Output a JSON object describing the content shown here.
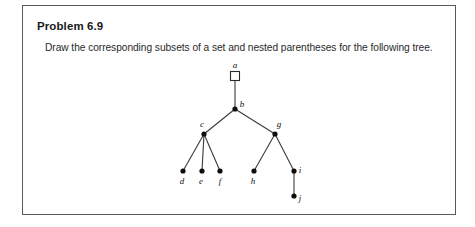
{
  "page": {
    "background_color": "#fefefe"
  },
  "problem": {
    "title": "Problem 6.9",
    "statement": "Draw the corresponding subsets of a set and nested parentheses for the following  tree.",
    "border_color": "#5a5a5a",
    "background_color": "#ffffff"
  },
  "figure": {
    "type": "tree-diagram",
    "name": "rooted-tree",
    "root_shape": "square",
    "node_shape": "filled-circle",
    "node_color": "#0d0d0d",
    "edge_color": "#3a3a3a",
    "nodes": [
      {
        "id": "a",
        "label": "a",
        "x": 212,
        "y": 70,
        "shape": "square",
        "label_dx": 0,
        "label_dy": -8
      },
      {
        "id": "b",
        "label": "b",
        "x": 212,
        "y": 103,
        "shape": "circle",
        "label_dx": 7,
        "label_dy": -2
      },
      {
        "id": "c",
        "label": "c",
        "x": 181,
        "y": 128,
        "shape": "circle",
        "label_dx": -2,
        "label_dy": -7
      },
      {
        "id": "g",
        "label": "g",
        "x": 252,
        "y": 128,
        "shape": "circle",
        "label_dx": 4,
        "label_dy": -7
      },
      {
        "id": "d",
        "label": "d",
        "x": 160,
        "y": 165,
        "shape": "circle",
        "label_dx": -1,
        "label_dy": 13
      },
      {
        "id": "e",
        "label": "e",
        "x": 179,
        "y": 165,
        "shape": "circle",
        "label_dx": -1,
        "label_dy": 13
      },
      {
        "id": "f",
        "label": "f",
        "x": 197,
        "y": 165,
        "shape": "circle",
        "label_dx": 0,
        "label_dy": 13
      },
      {
        "id": "h",
        "label": "h",
        "x": 231,
        "y": 165,
        "shape": "circle",
        "label_dx": -1,
        "label_dy": 13
      },
      {
        "id": "i",
        "label": "i",
        "x": 271,
        "y": 165,
        "shape": "circle",
        "label_dx": 6,
        "label_dy": 2
      },
      {
        "id": "j",
        "label": "j",
        "x": 271,
        "y": 190,
        "shape": "circle",
        "label_dx": 6,
        "label_dy": 5
      }
    ],
    "edges": [
      {
        "from": "a",
        "to": "b"
      },
      {
        "from": "b",
        "to": "c"
      },
      {
        "from": "b",
        "to": "g"
      },
      {
        "from": "c",
        "to": "d"
      },
      {
        "from": "c",
        "to": "e"
      },
      {
        "from": "c",
        "to": "f"
      },
      {
        "from": "g",
        "to": "h"
      },
      {
        "from": "g",
        "to": "i"
      },
      {
        "from": "i",
        "to": "j"
      }
    ]
  }
}
